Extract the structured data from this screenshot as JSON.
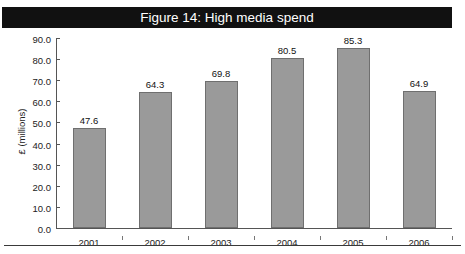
{
  "page": {
    "cropped_top_line": "",
    "bottom_rule": true
  },
  "figure": {
    "title": "Figure 14: High media spend",
    "title_bar_color": "#111111",
    "title_text_color": "#ffffff"
  },
  "chart_data": {
    "type": "bar",
    "title": "Figure 14: High media spend",
    "xlabel": "",
    "ylabel": "£ (millions)",
    "categories": [
      "2001",
      "2002",
      "2003",
      "2004",
      "2005",
      "2006"
    ],
    "values": [
      47.6,
      64.3,
      69.8,
      80.5,
      85.3,
      64.9
    ],
    "value_labels": [
      "47.6",
      "64.3",
      "69.8",
      "80.5",
      "85.3",
      "64.9"
    ],
    "ylim": [
      0,
      90
    ],
    "ytick_step": 10,
    "ytick_labels": [
      "90.0",
      "80.0",
      "70.0",
      "60.0",
      "50.0",
      "40.0",
      "30.0",
      "20.0",
      "10.0",
      "0.0"
    ],
    "ytick_values": [
      90,
      80,
      70,
      60,
      50,
      40,
      30,
      20,
      10,
      0
    ],
    "grid": false,
    "legend": false,
    "bar_color": "#9a9a9a",
    "bar_border_color": "#6f6f6f",
    "axis_color": "#555555"
  }
}
